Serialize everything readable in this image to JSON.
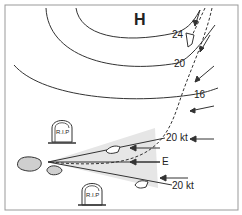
{
  "diagram": {
    "pressure_center": "H",
    "isobars": [
      {
        "label": "24"
      },
      {
        "label": "20"
      },
      {
        "label": "16"
      }
    ],
    "wind_labels": {
      "upper": "20 kt",
      "center": "E",
      "lower": "20 kt"
    },
    "graves": [
      {
        "label": "R.I.P"
      },
      {
        "label": "R.I.P"
      }
    ],
    "colors": {
      "line": "#333333",
      "shade": "#e6e6e6",
      "island": "#cfcfcf",
      "border": "#999999"
    }
  }
}
